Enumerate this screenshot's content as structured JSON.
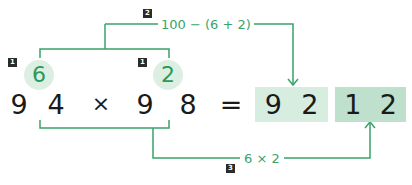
{
  "colors": {
    "accent_green": "#3aa36a",
    "circle_fill": "#dcefe2",
    "box_light": "#d6ede0",
    "box_dark": "#bfe0cc",
    "badge_bg": "#2b2b2b",
    "digit_color": "#1a1a1a"
  },
  "equation": {
    "left_operand": [
      "9",
      "4"
    ],
    "operator": "×",
    "right_operand": [
      "9",
      "8"
    ],
    "equals": "=",
    "result_part1": [
      "9",
      "2"
    ],
    "result_part2": [
      "1",
      "2"
    ]
  },
  "complements": {
    "left": "6",
    "right": "2"
  },
  "steps": {
    "step1_badge": "1",
    "step2_badge": "2",
    "step2_formula": "100 − (6 + 2)",
    "step3_badge": "3",
    "step3_formula": "6 × 2"
  }
}
